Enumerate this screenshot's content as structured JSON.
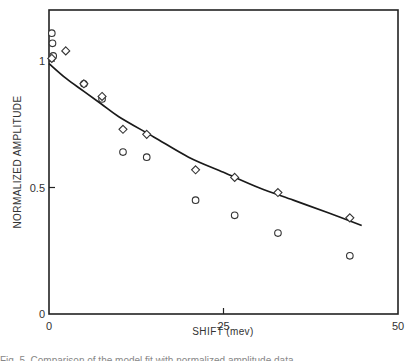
{
  "chart_data": {
    "type": "scatter",
    "title": "",
    "xlabel": "SHIFT (mev)",
    "ylabel": "NORMALIZED AMPLITUDE",
    "xlim": [
      0,
      50
    ],
    "ylim": [
      0,
      1.15
    ],
    "x_ticks": [
      0,
      25,
      50
    ],
    "x_tick_labels": [
      "0",
      "25",
      "50"
    ],
    "y_ticks": [
      0,
      0.5,
      1
    ],
    "y_tick_labels": [
      "0",
      "0.5",
      "1"
    ],
    "grid": false,
    "legend": null,
    "series": [
      {
        "name": "diamonds",
        "marker": "diamond",
        "x": [
          0.4,
          2.4,
          5.0,
          7.6,
          10.6,
          14.0,
          21.0,
          26.6,
          32.8,
          43.1
        ],
        "y": [
          1.01,
          1.04,
          0.91,
          0.86,
          0.73,
          0.71,
          0.57,
          0.54,
          0.48,
          0.38
        ]
      },
      {
        "name": "circles",
        "marker": "circle",
        "x": [
          0.4,
          0.5,
          0.6,
          5.0,
          7.6,
          10.6,
          14.0,
          21.0,
          26.6,
          32.8,
          43.1
        ],
        "y": [
          1.11,
          1.07,
          1.02,
          0.91,
          0.85,
          0.64,
          0.62,
          0.45,
          0.39,
          0.32,
          0.23
        ]
      },
      {
        "name": "fit curve",
        "marker": "line",
        "x": [
          0,
          2.5,
          5,
          7.5,
          10,
          15,
          20,
          25,
          30,
          35,
          40,
          44.8
        ],
        "y": [
          0.99,
          0.93,
          0.88,
          0.83,
          0.78,
          0.7,
          0.62,
          0.56,
          0.5,
          0.45,
          0.4,
          0.35
        ]
      }
    ]
  },
  "caption": "Fig. 5. Comparison of the model fit with normalized amplitude data"
}
